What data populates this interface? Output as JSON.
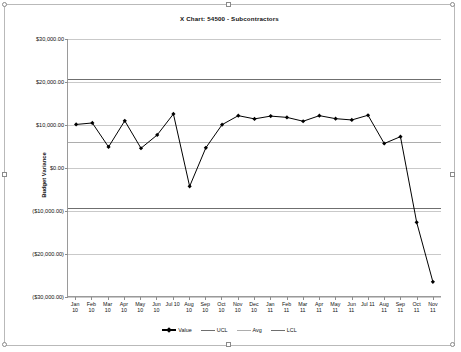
{
  "chart_data": {
    "type": "line",
    "title": "X Chart: 54500 - Subcontractors",
    "xlabel": "",
    "ylabel": "Budget Variance",
    "ylim": [
      -30000,
      30000
    ],
    "ytick_values": [
      30000,
      20000,
      10000,
      0,
      -10000,
      -20000,
      -30000
    ],
    "ytick_labels": [
      "$30,000.00",
      "$20,000.00",
      "$10,000.00",
      "$0.00",
      "($10,000.00)",
      "($20,000.00)",
      "($30,000.00)"
    ],
    "grid": true,
    "legend_position": "bottom",
    "categories": [
      "Jan 10",
      "Feb 10",
      "Mar 10",
      "Apr 10",
      "May 10",
      "Jun 10",
      "Jul 10",
      "Aug 10",
      "Sep 10",
      "Oct 10",
      "Nov 10",
      "Dec 10",
      "Jan 11",
      "Feb 11",
      "Mar 11",
      "Apr 11",
      "May 11",
      "Jun 11",
      "Jul 11",
      "Aug 11",
      "Sep 11",
      "Oct 11",
      "Nov 11"
    ],
    "category_lines": [
      [
        "Jan",
        "10"
      ],
      [
        "Feb",
        "10"
      ],
      [
        "Mar",
        "10"
      ],
      [
        "Apr",
        "10"
      ],
      [
        "May",
        "10"
      ],
      [
        "Jun",
        "10"
      ],
      [
        "Jul 10",
        ""
      ],
      [
        "Aug",
        "10"
      ],
      [
        "Sep",
        "10"
      ],
      [
        "Oct",
        "10"
      ],
      [
        "Nov",
        "10"
      ],
      [
        "Dec",
        "10"
      ],
      [
        "Jan",
        "11"
      ],
      [
        "Feb",
        "11"
      ],
      [
        "Mar",
        "11"
      ],
      [
        "Apr",
        "11"
      ],
      [
        "May",
        "11"
      ],
      [
        "Jun",
        "11"
      ],
      [
        "Jul 11",
        ""
      ],
      [
        "Aug",
        "11"
      ],
      [
        "Sep",
        "11"
      ],
      [
        "Oct",
        "11"
      ],
      [
        "Nov",
        "11"
      ]
    ],
    "series": [
      {
        "name": "Value",
        "type": "line-marker",
        "color": "#000000",
        "values": [
          10050,
          10400,
          4800,
          10900,
          4500,
          7600,
          12500,
          -4400,
          4600,
          10000,
          12100,
          11350,
          12000,
          11700,
          10800,
          12100,
          11400,
          11100,
          12200,
          5600,
          7200,
          -12800,
          -26700
        ]
      },
      {
        "name": "UCL",
        "type": "constant-line",
        "color": "#6f6f6f",
        "value": 20700
      },
      {
        "name": "Avg",
        "type": "constant-line",
        "color": "#adadad",
        "value": 6050
      },
      {
        "name": "LCL",
        "type": "constant-line",
        "color": "#6f6f6f",
        "value": -9300
      }
    ]
  },
  "legend": {
    "items": [
      {
        "label": "Value"
      },
      {
        "label": "UCL"
      },
      {
        "label": "Avg"
      },
      {
        "label": "LCL"
      }
    ]
  },
  "colors": {
    "series": "#000000",
    "control_limit": "#6f6f6f",
    "average": "#adadad",
    "grid": "#c9c9c9",
    "axis": "#9a9a9a",
    "background": "#ffffff"
  }
}
